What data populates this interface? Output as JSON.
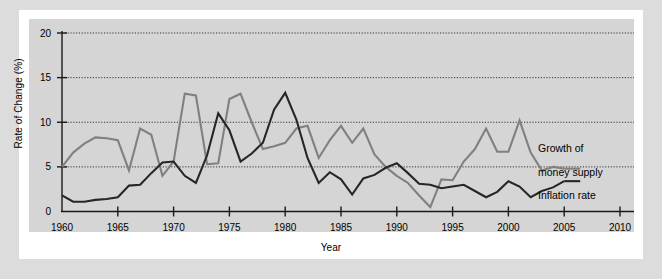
{
  "chart_data": {
    "type": "line",
    "title": "",
    "xlabel": "Year",
    "ylabel": "Rate of Change (%)",
    "xlim": [
      1960,
      2010
    ],
    "ylim": [
      0,
      20
    ],
    "xticks": [
      1960,
      1965,
      1970,
      1975,
      1980,
      1985,
      1990,
      1995,
      2000,
      2005,
      2010
    ],
    "yticks": [
      0,
      5,
      10,
      15,
      20
    ],
    "grid": "horizontal-dotted",
    "legend_position": "inline-annotations",
    "x": [
      1960,
      1961,
      1962,
      1963,
      1964,
      1965,
      1966,
      1967,
      1968,
      1969,
      1970,
      1971,
      1972,
      1973,
      1974,
      1975,
      1976,
      1977,
      1978,
      1979,
      1980,
      1981,
      1982,
      1983,
      1984,
      1985,
      1986,
      1987,
      1988,
      1989,
      1990,
      1991,
      1992,
      1993,
      1994,
      1995,
      1996,
      1997,
      1998,
      1999,
      2000,
      2001,
      2002,
      2003,
      2004,
      2005
    ],
    "series": [
      {
        "name": "Growth of money supply",
        "color": "#808080",
        "values": [
          5.0,
          6.6,
          7.6,
          8.3,
          8.2,
          8.0,
          4.6,
          9.3,
          8.6,
          4.0,
          5.6,
          13.2,
          13.0,
          5.3,
          5.4,
          12.6,
          13.2,
          10.0,
          7.0,
          7.3,
          7.7,
          9.3,
          9.6,
          6.0,
          8.0,
          9.6,
          7.7,
          9.3,
          6.4,
          5.0,
          4.0,
          3.2,
          1.8,
          0.5,
          3.6,
          3.5,
          5.6,
          7.0,
          9.3,
          6.7,
          6.7,
          10.2,
          6.6,
          4.6,
          5.0,
          4.8
        ]
      },
      {
        "name": "Inflation rate",
        "color": "#262626",
        "values": [
          1.8,
          1.1,
          1.1,
          1.3,
          1.4,
          1.6,
          2.9,
          3.0,
          4.3,
          5.5,
          5.6,
          4.0,
          3.2,
          6.3,
          11.0,
          9.1,
          5.6,
          6.5,
          7.7,
          11.4,
          13.3,
          10.3,
          6.0,
          3.2,
          4.4,
          3.6,
          1.9,
          3.7,
          4.1,
          4.9,
          5.4,
          4.3,
          3.1,
          3.0,
          2.6,
          2.8,
          3.0,
          2.3,
          1.6,
          2.2,
          3.4,
          2.8,
          1.6,
          2.3,
          2.7,
          3.4
        ]
      }
    ],
    "annotations": [
      {
        "name": "money-supply-label",
        "text": "Growth of\nmoney supply",
        "x": 2005,
        "y": 7.4
      },
      {
        "name": "inflation-label",
        "text": "Inflation rate",
        "x": 2005,
        "y": 2.8
      }
    ]
  },
  "axis": {
    "ylabel_text": "Rate of Change (%)",
    "xlabel_text": "Year"
  },
  "labels": {
    "money_supply_line1": "Growth of",
    "money_supply_line2": "money supply",
    "inflation": "Inflation rate"
  },
  "colors": {
    "page_background": "#dcdcdc",
    "card_background": "#ffffff",
    "plot_background": "#d5d5d5",
    "money_supply": "#808080",
    "inflation": "#262626",
    "axis": "#1a1a1a",
    "grid": "#333333"
  }
}
